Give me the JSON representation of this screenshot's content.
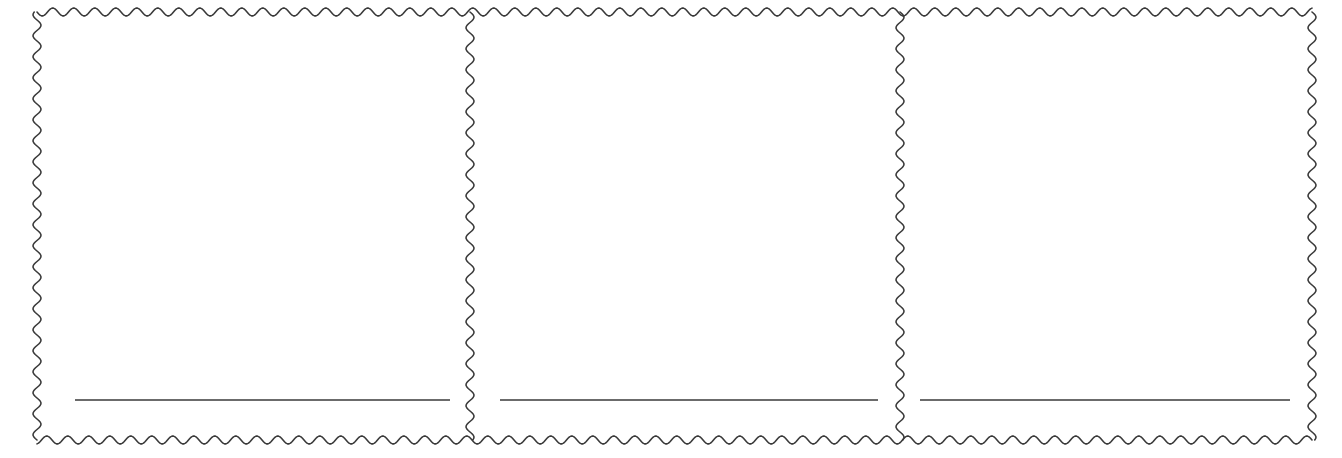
{
  "document": {
    "title": "Blank triple-panel scalloped template",
    "background_color": "#ffffff",
    "width": 1342,
    "height": 458
  },
  "style": {
    "border_color": "#3a3a3a",
    "border_stroke_width": 1.6,
    "wave_period": 21,
    "wave_amplitude": 4,
    "rule_color": "#3a3a3a",
    "rule_stroke_width": 1.5
  },
  "frame": {
    "name": "scalloped-outer-frame",
    "left": 37,
    "top": 12,
    "right": 1312,
    "bottom": 440,
    "edge_style": "wavy-scalloped"
  },
  "dividers": [
    {
      "name": "panel-divider-1",
      "x": 470,
      "style": "wavy-scalloped"
    },
    {
      "name": "panel-divider-2",
      "x": 900,
      "style": "wavy-scalloped"
    }
  ],
  "panels": [
    {
      "id": "panel-1",
      "label": "",
      "body_text": "",
      "x": 37,
      "width": 433,
      "rule": {
        "x1": 75,
        "x2": 450,
        "y": 400,
        "label": ""
      }
    },
    {
      "id": "panel-2",
      "label": "",
      "body_text": "",
      "x": 470,
      "width": 430,
      "rule": {
        "x1": 500,
        "x2": 878,
        "y": 400,
        "label": ""
      }
    },
    {
      "id": "panel-3",
      "label": "",
      "body_text": "",
      "x": 900,
      "width": 412,
      "rule": {
        "x1": 920,
        "x2": 1290,
        "y": 400,
        "label": ""
      }
    }
  ]
}
